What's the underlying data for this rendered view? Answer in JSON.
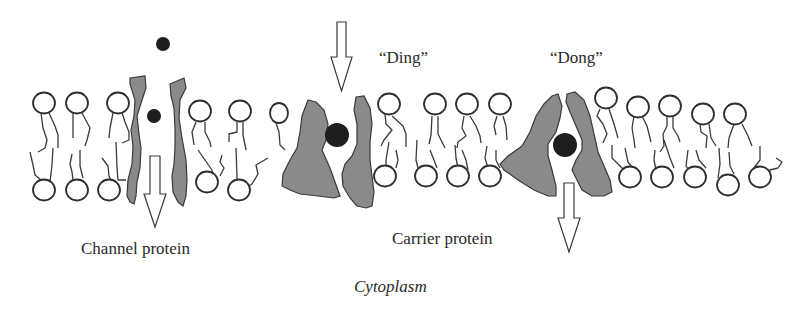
{
  "diagram": {
    "labels": {
      "channel_protein": "Channel protein",
      "carrier_protein": "Carrier protein",
      "ding": "“Ding”",
      "dong": "“Dong”",
      "cytoplasm": "Cytoplasm"
    },
    "components": [
      {
        "id": "lipid-bilayer",
        "type": "phospholipid bilayer"
      },
      {
        "id": "channel-protein",
        "type": "channel protein",
        "solute_count": 2,
        "arrow": "down"
      },
      {
        "id": "carrier-protein-ding",
        "type": "carrier protein (open outward)",
        "state": "Ding",
        "arrow": "down-into-carrier"
      },
      {
        "id": "carrier-protein-dong",
        "type": "carrier protein (open inward)",
        "state": "Dong",
        "arrow": "down-out-of-carrier"
      }
    ],
    "regions": {
      "bottom": "Cytoplasm"
    },
    "colors": {
      "protein_fill": "#8a8a8a",
      "solute": "#1e1e1e",
      "outline": "#2e2e2e",
      "background": "#ffffff"
    }
  }
}
